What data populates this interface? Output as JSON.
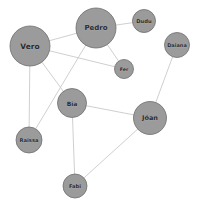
{
  "diagram": {
    "type": "node-link-graph",
    "canvas": {
      "width": 201,
      "height": 204,
      "background": "#ffffff"
    },
    "style": {
      "node_fill": "#9b9b9b",
      "node_stroke": "#6f6f6f",
      "edge_color": "#c9c9c9",
      "label_color": "#2b2b2b"
    },
    "nodes": [
      {
        "id": "vero",
        "label": "Vero",
        "x": 30,
        "y": 46,
        "r": 20,
        "font_size": 7.5
      },
      {
        "id": "pedro",
        "label": "Pedro",
        "x": 96,
        "y": 28,
        "r": 20,
        "font_size": 7.0
      },
      {
        "id": "dudu",
        "label": "Dudu",
        "x": 144,
        "y": 21,
        "r": 11.5,
        "font_size": 5.2
      },
      {
        "id": "daiana",
        "label": "Daiana",
        "x": 177,
        "y": 45,
        "r": 12.5,
        "font_size": 5.0
      },
      {
        "id": "fer",
        "label": "Fer",
        "x": 124,
        "y": 69,
        "r": 9.5,
        "font_size": 4.8
      },
      {
        "id": "bia",
        "label": "Bia",
        "x": 72,
        "y": 103,
        "r": 14.5,
        "font_size": 6.0
      },
      {
        "id": "joao",
        "label": "Jóan",
        "x": 150,
        "y": 118,
        "r": 16.5,
        "font_size": 6.5
      },
      {
        "id": "raissa",
        "label": "Raissa",
        "x": 29,
        "y": 140,
        "r": 13.0,
        "font_size": 5.2
      },
      {
        "id": "fabi",
        "label": "Fabi",
        "x": 75,
        "y": 186,
        "r": 12.0,
        "font_size": 5.2
      }
    ],
    "edges": [
      {
        "source": "vero",
        "target": "pedro"
      },
      {
        "source": "vero",
        "target": "fer"
      },
      {
        "source": "vero",
        "target": "bia"
      },
      {
        "source": "vero",
        "target": "raissa"
      },
      {
        "source": "pedro",
        "target": "dudu"
      },
      {
        "source": "pedro",
        "target": "fer"
      },
      {
        "source": "pedro",
        "target": "raissa"
      },
      {
        "source": "daiana",
        "target": "joao"
      },
      {
        "source": "bia",
        "target": "joao"
      },
      {
        "source": "bia",
        "target": "fabi"
      },
      {
        "source": "fabi",
        "target": "joao"
      }
    ]
  }
}
